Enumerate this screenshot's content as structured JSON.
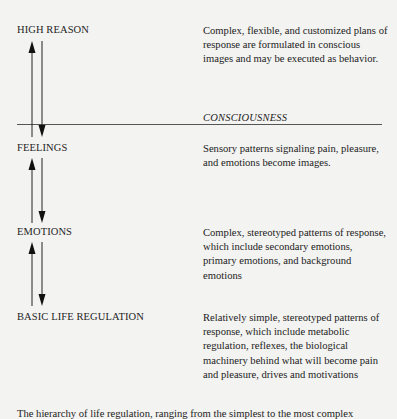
{
  "levels": [
    {
      "label": "HIGH REASON",
      "description": "Complex, flexible, and customized plans of response are formulated in conscious images and may be executed as behavior."
    },
    {
      "label": "FEELINGS",
      "description": "Sensory patterns signaling pain, pleasure, and emotions become images."
    },
    {
      "label": "EMOTIONS",
      "description": "Complex, stereotyped patterns of response, which include secondary emotions, primary emotions, and background emotions"
    },
    {
      "label": "BASIC LIFE REGULATION",
      "description": "Relatively simple, stereotyped patterns of response, which include metabolic regulation, reflexes, the biological machinery behind what will become pain and pleasure, drives and motivations"
    }
  ],
  "divider_label": "CONSCIOUSNESS",
  "arrows": [
    {
      "between": [
        "HIGH REASON",
        "FEELINGS"
      ],
      "up": "up-arrow-icon",
      "down": "down-arrow-icon"
    },
    {
      "between": [
        "FEELINGS",
        "EMOTIONS"
      ],
      "up": "up-arrow-icon",
      "down": "down-arrow-icon"
    },
    {
      "between": [
        "EMOTIONS",
        "BASIC LIFE REGULATION"
      ],
      "up": "up-arrow-icon",
      "down": "down-arrow-icon"
    }
  ],
  "caption": "The hierarchy of life regulation, ranging from the simplest to the most complex"
}
